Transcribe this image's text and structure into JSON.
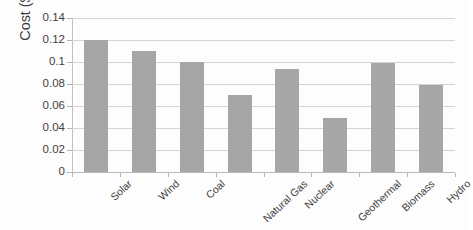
{
  "chart_data": {
    "type": "bar",
    "title": "",
    "xlabel": "",
    "ylabel": "Cost ($/kWh)",
    "categories": [
      "Solar",
      "Wind",
      "Coal",
      "Natural Gas",
      "Nuclear",
      "Geothermal",
      "Biomass",
      "Hydro"
    ],
    "values": [
      0.12,
      0.11,
      0.1,
      0.07,
      0.094,
      0.049,
      0.099,
      0.079
    ],
    "series": [
      {
        "name": "Cost ($/kWh)",
        "values": [
          0.12,
          0.11,
          0.1,
          0.07,
          0.094,
          0.049,
          0.099,
          0.079
        ]
      }
    ],
    "ylim": [
      0,
      0.14
    ],
    "yticks": [
      0,
      0.02,
      0.04,
      0.06,
      0.08,
      0.1,
      0.12,
      0.14
    ],
    "ytick_labels": [
      "0",
      "0.02",
      "0.04",
      "0.06",
      "0.08",
      "0.1",
      "0.12",
      "0.14"
    ],
    "grid": true,
    "grid_axis": "y",
    "legend": false,
    "legend_position": "none",
    "bar_color": "#a6a6a6",
    "gridline_color": "#d3d3d3",
    "axis_color": "#b9b9b9",
    "background_color": "#fdfdfd",
    "xtick_label_rotation": -43
  }
}
